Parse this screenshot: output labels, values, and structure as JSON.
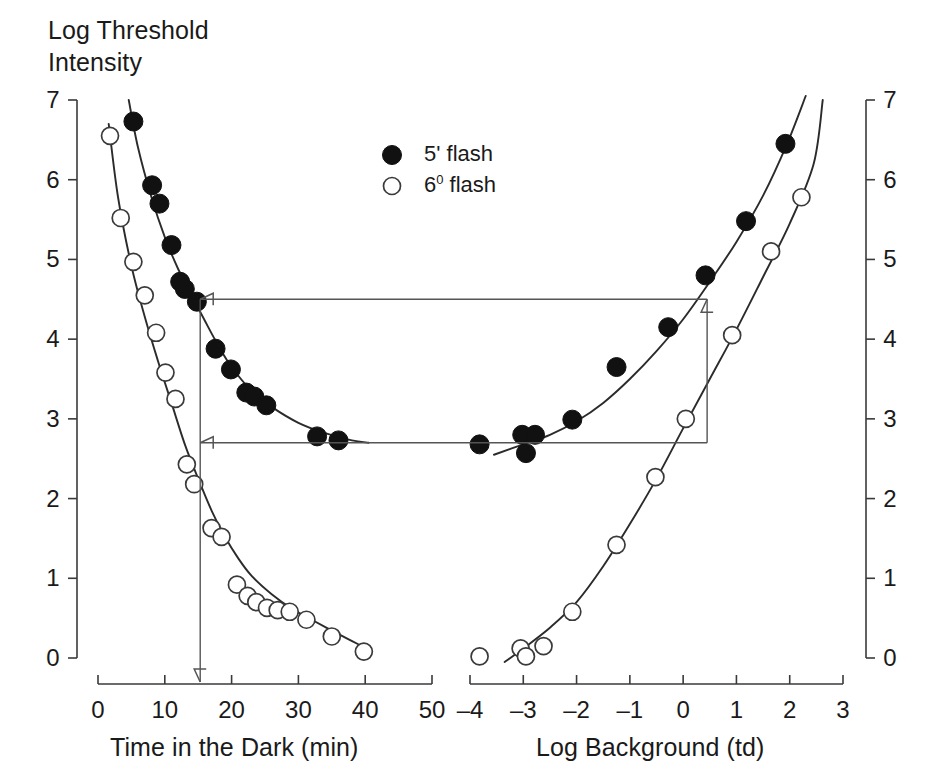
{
  "chart_data": {
    "type": "scatter",
    "title": "",
    "ylabel": "Log Threshold\nIntensity",
    "ylim": [
      0,
      7
    ],
    "yticks": [
      0,
      1,
      2,
      3,
      4,
      5,
      6,
      7
    ],
    "grid": false,
    "legend_position": "upper-center",
    "legend": [
      {
        "marker": "filled-circle",
        "label": "5' flash",
        "base": "5'",
        "sup": "",
        "suffix": " flash"
      },
      {
        "marker": "open-circle",
        "label": "6⁰ flash",
        "base": "6",
        "sup": "0",
        "suffix": " flash"
      }
    ],
    "panels": [
      {
        "name": "dark-adaptation",
        "xlabel": "Time in the Dark (min)",
        "xlim": [
          0,
          50
        ],
        "xticks": [
          0,
          10,
          20,
          30,
          40,
          50
        ],
        "xtick_labels": [
          "0",
          "10",
          "20",
          "30",
          "40",
          "50"
        ],
        "series": [
          {
            "name": "5' flash",
            "marker": "filled-circle",
            "points": [
              [
                5.3,
                6.73
              ],
              [
                8.1,
                5.93
              ],
              [
                9.2,
                5.7
              ],
              [
                11.0,
                5.18
              ],
              [
                12.3,
                4.72
              ],
              [
                13.0,
                4.63
              ],
              [
                14.8,
                4.47
              ],
              [
                17.6,
                3.88
              ],
              [
                19.9,
                3.62
              ],
              [
                22.2,
                3.33
              ],
              [
                23.4,
                3.28
              ],
              [
                25.2,
                3.17
              ],
              [
                32.8,
                2.78
              ],
              [
                36.0,
                2.73
              ]
            ],
            "fit_curve": [
              [
                4.6,
                7.0
              ],
              [
                6,
                6.4
              ],
              [
                8,
                5.78
              ],
              [
                10,
                5.28
              ],
              [
                12,
                4.88
              ],
              [
                14,
                4.55
              ],
              [
                16,
                4.23
              ],
              [
                18,
                3.92
              ],
              [
                20,
                3.65
              ],
              [
                23,
                3.35
              ],
              [
                26,
                3.15
              ],
              [
                30,
                2.95
              ],
              [
                34,
                2.82
              ],
              [
                38,
                2.73
              ],
              [
                40.5,
                2.7
              ]
            ]
          },
          {
            "name": "6⁰ flash",
            "marker": "open-circle",
            "points": [
              [
                1.8,
                6.55
              ],
              [
                3.4,
                5.52
              ],
              [
                5.3,
                4.97
              ],
              [
                7.0,
                4.55
              ],
              [
                8.7,
                4.08
              ],
              [
                10.1,
                3.58
              ],
              [
                11.6,
                3.25
              ],
              [
                13.3,
                2.43
              ],
              [
                14.4,
                2.18
              ],
              [
                17.0,
                1.63
              ],
              [
                18.5,
                1.52
              ],
              [
                20.8,
                0.92
              ],
              [
                22.4,
                0.78
              ],
              [
                23.7,
                0.7
              ],
              [
                25.3,
                0.63
              ],
              [
                26.9,
                0.6
              ],
              [
                28.7,
                0.58
              ],
              [
                31.2,
                0.48
              ],
              [
                35.0,
                0.27
              ],
              [
                39.8,
                0.08
              ]
            ],
            "fit_curve": [
              [
                1.6,
                6.7
              ],
              [
                3,
                5.78
              ],
              [
                5,
                4.92
              ],
              [
                7,
                4.28
              ],
              [
                9,
                3.72
              ],
              [
                11,
                3.2
              ],
              [
                13,
                2.68
              ],
              [
                15,
                2.25
              ],
              [
                17,
                1.85
              ],
              [
                19,
                1.52
              ],
              [
                21,
                1.25
              ],
              [
                23,
                1.03
              ],
              [
                26,
                0.8
              ],
              [
                29,
                0.62
              ],
              [
                32,
                0.48
              ],
              [
                36,
                0.3
              ],
              [
                39.5,
                0.15
              ]
            ]
          }
        ]
      },
      {
        "name": "threshold-vs-intensity",
        "xlabel": "Log Background (td)",
        "xlim": [
          -4,
          3
        ],
        "xticks": [
          -4,
          -3,
          -2,
          -1,
          0,
          1,
          2,
          3
        ],
        "xtick_labels": [
          "–4",
          "–3",
          "–2",
          "–1",
          "0",
          "1",
          "2",
          "3"
        ],
        "series": [
          {
            "name": "5' flash",
            "marker": "filled-circle",
            "points": [
              [
                -3.82,
                2.68
              ],
              [
                -3.02,
                2.8
              ],
              [
                -2.95,
                2.57
              ],
              [
                -2.78,
                2.8
              ],
              [
                -2.08,
                2.99
              ],
              [
                -1.25,
                3.65
              ],
              [
                -0.28,
                4.15
              ],
              [
                0.42,
                4.8
              ],
              [
                1.18,
                5.48
              ],
              [
                1.92,
                6.45
              ]
            ],
            "fit_curve": [
              [
                -3.55,
                2.55
              ],
              [
                -3.0,
                2.68
              ],
              [
                -2.5,
                2.8
              ],
              [
                -2.0,
                2.97
              ],
              [
                -1.5,
                3.2
              ],
              [
                -1.0,
                3.5
              ],
              [
                -0.5,
                3.85
              ],
              [
                0.0,
                4.25
              ],
              [
                0.5,
                4.72
              ],
              [
                1.0,
                5.22
              ],
              [
                1.5,
                5.8
              ],
              [
                1.95,
                6.45
              ],
              [
                2.3,
                7.05
              ]
            ]
          },
          {
            "name": "6⁰ flash",
            "marker": "open-circle",
            "points": [
              [
                -3.82,
                0.02
              ],
              [
                -3.05,
                0.12
              ],
              [
                -2.95,
                0.02
              ],
              [
                -2.62,
                0.15
              ],
              [
                -2.08,
                0.58
              ],
              [
                -1.25,
                1.42
              ],
              [
                -0.52,
                2.27
              ],
              [
                0.05,
                3.0
              ],
              [
                0.92,
                4.05
              ],
              [
                1.65,
                5.1
              ],
              [
                2.22,
                5.78
              ]
            ],
            "fit_curve": [
              [
                -3.35,
                -0.05
              ],
              [
                -3.0,
                0.12
              ],
              [
                -2.5,
                0.38
              ],
              [
                -2.0,
                0.7
              ],
              [
                -1.5,
                1.15
              ],
              [
                -1.0,
                1.68
              ],
              [
                -0.5,
                2.25
              ],
              [
                0.0,
                2.88
              ],
              [
                0.5,
                3.5
              ],
              [
                1.0,
                4.12
              ],
              [
                1.5,
                4.78
              ],
              [
                2.0,
                5.45
              ],
              [
                2.45,
                6.2
              ],
              [
                2.62,
                7.0
              ]
            ]
          }
        ]
      }
    ],
    "annotations": [
      {
        "name": "cone-plateau-link",
        "description": "horizontal arrow from right panel to left panel at threshold 4.5",
        "y_value": 4.5,
        "from_panel": "threshold-vs-intensity",
        "from_x": 0.45,
        "to_panel": "dark-adaptation",
        "to_x": 15.3,
        "arrow": "left"
      },
      {
        "name": "rod-plateau-link",
        "description": "horizontal arrow from right panel to left panel at threshold 2.7",
        "y_value": 2.7,
        "from_panel": "threshold-vs-intensity",
        "from_x": 0.45,
        "to_panel": "dark-adaptation",
        "to_x": 15.3,
        "arrow": "left"
      },
      {
        "name": "time-dropline",
        "description": "vertical arrow down to the time axis at 15.3 min",
        "panel": "dark-adaptation",
        "x_value": 15.3,
        "y_from": 4.5,
        "y_to": 0,
        "arrow": "down"
      },
      {
        "name": "background-upline",
        "description": "vertical arrow at log background 0.45 in the right panel",
        "panel": "threshold-vs-intensity",
        "x_value": 0.45,
        "y_from": 2.7,
        "y_to": 4.5,
        "arrow": "up"
      }
    ]
  }
}
